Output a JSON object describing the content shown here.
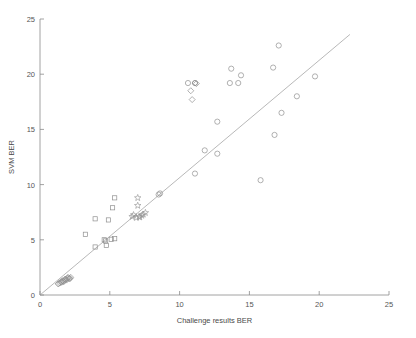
{
  "chart_data": {
    "type": "scatter",
    "title": "",
    "xlabel": "Challenge results BER",
    "ylabel": "SVM BER",
    "xlim": [
      0,
      25
    ],
    "ylim": [
      0,
      25
    ],
    "xticks": [
      0,
      5,
      10,
      15,
      20,
      25
    ],
    "yticks": [
      0,
      5,
      10,
      15,
      20,
      25
    ],
    "xtick_labels": [
      "0",
      "5",
      "10",
      "15",
      "20",
      "25"
    ],
    "ytick_labels": [
      "0",
      "5",
      "10",
      "15",
      "20",
      "25"
    ],
    "grid": false,
    "legend": "none",
    "reference_line": {
      "name": "identity-line",
      "description": "y = x diagonal reference line",
      "x": [
        0.05,
        22.2
      ],
      "y": [
        0.05,
        23.6
      ]
    },
    "series": [
      {
        "name": "circle-group",
        "marker": "circle",
        "color": "#8f8f8f",
        "points": [
          [
            17.1,
            22.6
          ],
          [
            16.7,
            20.6
          ],
          [
            13.7,
            20.5
          ],
          [
            14.4,
            19.9
          ],
          [
            19.7,
            19.8
          ],
          [
            13.6,
            19.2
          ],
          [
            14.2,
            19.2
          ],
          [
            11.1,
            19.2
          ],
          [
            10.6,
            19.2
          ],
          [
            18.4,
            18.0
          ],
          [
            17.3,
            16.5
          ],
          [
            12.7,
            15.7
          ],
          [
            16.8,
            14.5
          ],
          [
            12.7,
            12.8
          ],
          [
            11.8,
            13.1
          ],
          [
            11.1,
            11.0
          ],
          [
            15.8,
            10.4
          ],
          [
            8.6,
            9.2
          ],
          [
            8.5,
            9.1
          ]
        ]
      },
      {
        "name": "square-group",
        "marker": "square",
        "color": "#8f8f8f",
        "points": [
          [
            5.35,
            8.8
          ],
          [
            5.2,
            7.9
          ],
          [
            3.95,
            6.9
          ],
          [
            4.9,
            6.8
          ],
          [
            3.25,
            5.5
          ],
          [
            5.35,
            5.1
          ],
          [
            4.6,
            5.0
          ],
          [
            4.7,
            4.9
          ],
          [
            4.75,
            4.5
          ],
          [
            3.95,
            4.35
          ],
          [
            5.1,
            5.05
          ]
        ]
      },
      {
        "name": "star-group",
        "marker": "star",
        "color": "#8f8f8f",
        "points": [
          [
            7.0,
            8.8
          ],
          [
            7.0,
            8.1
          ],
          [
            6.7,
            7.25
          ],
          [
            6.6,
            7.1
          ],
          [
            6.9,
            7.0
          ],
          [
            7.15,
            7.05
          ],
          [
            7.4,
            7.3
          ],
          [
            7.55,
            7.45
          ],
          [
            7.3,
            7.2
          ],
          [
            7.1,
            7.1
          ]
        ]
      },
      {
        "name": "diamond-group",
        "marker": "diamond",
        "color": "#8f8f8f",
        "points": [
          [
            11.1,
            19.2
          ],
          [
            10.8,
            18.5
          ],
          [
            10.9,
            17.7
          ],
          [
            11.2,
            19.15
          ],
          [
            2.05,
            1.55
          ],
          [
            1.95,
            1.5
          ],
          [
            1.85,
            1.4
          ],
          [
            1.75,
            1.3
          ],
          [
            1.65,
            1.25
          ],
          [
            1.55,
            1.15
          ],
          [
            1.45,
            1.1
          ],
          [
            2.1,
            1.45
          ],
          [
            1.9,
            1.35
          ],
          [
            1.7,
            1.2
          ],
          [
            2.2,
            1.6
          ],
          [
            1.3,
            1.0
          ],
          [
            1.6,
            1.3
          ],
          [
            2.0,
            1.6
          ],
          [
            1.8,
            1.45
          ],
          [
            2.15,
            1.5
          ],
          [
            1.5,
            1.2
          ],
          [
            1.35,
            1.05
          ]
        ]
      }
    ]
  }
}
